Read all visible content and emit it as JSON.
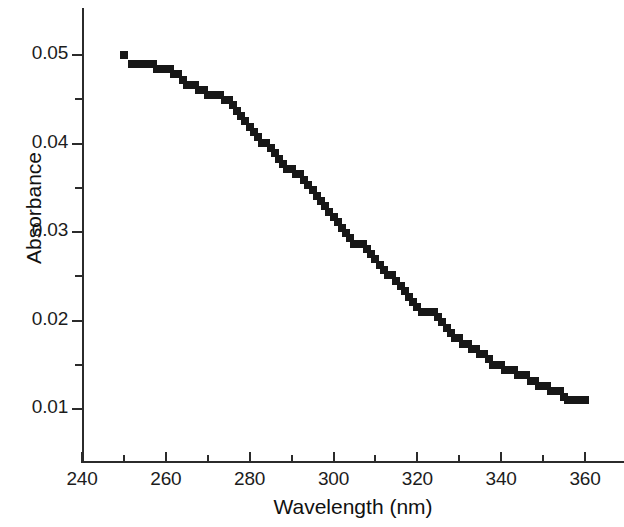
{
  "chart_data": {
    "type": "scatter",
    "title": "",
    "xlabel": "Wavelength (nm)",
    "ylabel": "Absorbance",
    "xlim": [
      240,
      369
    ],
    "ylim": [
      0.0042,
      0.0551
    ],
    "xticks": [
      240,
      260,
      280,
      300,
      320,
      340,
      360
    ],
    "xtick_labels": [
      "240",
      "260",
      "280",
      "300",
      "320",
      "340",
      "360"
    ],
    "xminor_ticks": [
      250,
      270,
      290,
      310,
      330,
      350
    ],
    "yticks": [
      0.01,
      0.02,
      0.03,
      0.04,
      0.05
    ],
    "ytick_labels": [
      "0.01",
      "0.02",
      "0.03",
      "0.04",
      "0.05"
    ],
    "yminor_ticks": [
      0.015,
      0.025,
      0.035,
      0.045
    ],
    "grid": false,
    "legend": null,
    "marker_shape": "square",
    "marker_color": "#171717",
    "marker_size_px": 8,
    "axis_color": "#2b2b2b",
    "background": "#ffffff",
    "x": [
      250,
      252,
      253,
      254,
      255,
      256,
      257,
      258,
      259,
      260,
      261,
      262,
      263,
      264,
      265,
      266,
      267,
      268,
      269,
      270,
      271,
      272,
      273,
      274,
      275,
      276,
      277,
      278,
      279,
      280,
      281,
      282,
      283,
      284,
      285,
      286,
      287,
      288,
      289,
      290,
      291,
      292,
      293,
      294,
      295,
      296,
      297,
      298,
      299,
      300,
      301,
      302,
      303,
      304,
      305,
      306,
      307,
      308,
      309,
      310,
      311,
      312,
      313,
      314,
      315,
      316,
      317,
      318,
      319,
      320,
      321,
      322,
      323,
      324,
      325,
      326,
      327,
      328,
      329,
      330,
      331,
      332,
      333,
      334,
      335,
      336,
      337,
      338,
      339,
      340,
      341,
      342,
      343,
      344,
      345,
      346,
      347,
      348,
      349,
      350,
      351,
      352,
      353,
      354,
      355,
      356,
      357,
      358,
      359,
      360
    ],
    "y": [
      0.05,
      0.049,
      0.049,
      0.049,
      0.049,
      0.049,
      0.049,
      0.0484,
      0.0484,
      0.0484,
      0.0484,
      0.0478,
      0.0478,
      0.0472,
      0.0466,
      0.0466,
      0.0466,
      0.0461,
      0.0461,
      0.0455,
      0.0455,
      0.0455,
      0.0455,
      0.0449,
      0.0449,
      0.0443,
      0.0437,
      0.0431,
      0.0425,
      0.0419,
      0.0413,
      0.0407,
      0.0401,
      0.0401,
      0.0395,
      0.0389,
      0.0383,
      0.0377,
      0.0371,
      0.0371,
      0.0365,
      0.0365,
      0.0359,
      0.0353,
      0.0347,
      0.0341,
      0.0335,
      0.0329,
      0.0323,
      0.0317,
      0.0311,
      0.0305,
      0.0299,
      0.0293,
      0.0287,
      0.0287,
      0.0287,
      0.0281,
      0.0275,
      0.0269,
      0.0263,
      0.0257,
      0.0251,
      0.0251,
      0.0245,
      0.0239,
      0.0233,
      0.0227,
      0.0221,
      0.0215,
      0.021,
      0.021,
      0.021,
      0.021,
      0.0204,
      0.0198,
      0.0192,
      0.0186,
      0.018,
      0.018,
      0.0174,
      0.0174,
      0.0168,
      0.0168,
      0.0162,
      0.0162,
      0.0156,
      0.015,
      0.015,
      0.015,
      0.0144,
      0.0144,
      0.0144,
      0.0138,
      0.0138,
      0.0138,
      0.0132,
      0.0132,
      0.0126,
      0.0126,
      0.0126,
      0.012,
      0.012,
      0.012,
      0.0114,
      0.011,
      0.011,
      0.011,
      0.011,
      0.011
    ]
  }
}
